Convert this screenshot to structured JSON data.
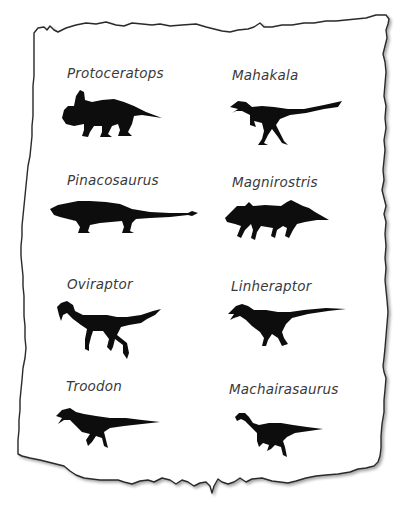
{
  "sheet": {
    "background_color": "#ffffff",
    "paper_color": "#ffffff",
    "outline_color": "#2a2a2a",
    "silhouette_color": "#0d0d0d",
    "label_color": "#3a3a3a"
  },
  "dinosaurs": [
    {
      "name": "Protoceratops",
      "column": "left",
      "row": 1,
      "icon": "protoceratops-silhouette"
    },
    {
      "name": "Mahakala",
      "column": "right",
      "row": 1,
      "icon": "mahakala-silhouette"
    },
    {
      "name": "Pinacosaurus",
      "column": "left",
      "row": 2,
      "icon": "pinacosaurus-silhouette"
    },
    {
      "name": "Magnirostris",
      "column": "right",
      "row": 2,
      "icon": "magnirostris-silhouette"
    },
    {
      "name": "Oviraptor",
      "column": "left",
      "row": 3,
      "icon": "oviraptor-silhouette"
    },
    {
      "name": "Linheraptor",
      "column": "right",
      "row": 3,
      "icon": "linheraptor-silhouette"
    },
    {
      "name": "Troodon",
      "column": "left",
      "row": 4,
      "icon": "troodon-silhouette"
    },
    {
      "name": "Machairasaurus",
      "column": "right",
      "row": 4,
      "icon": "machairasaurus-silhouette"
    }
  ]
}
